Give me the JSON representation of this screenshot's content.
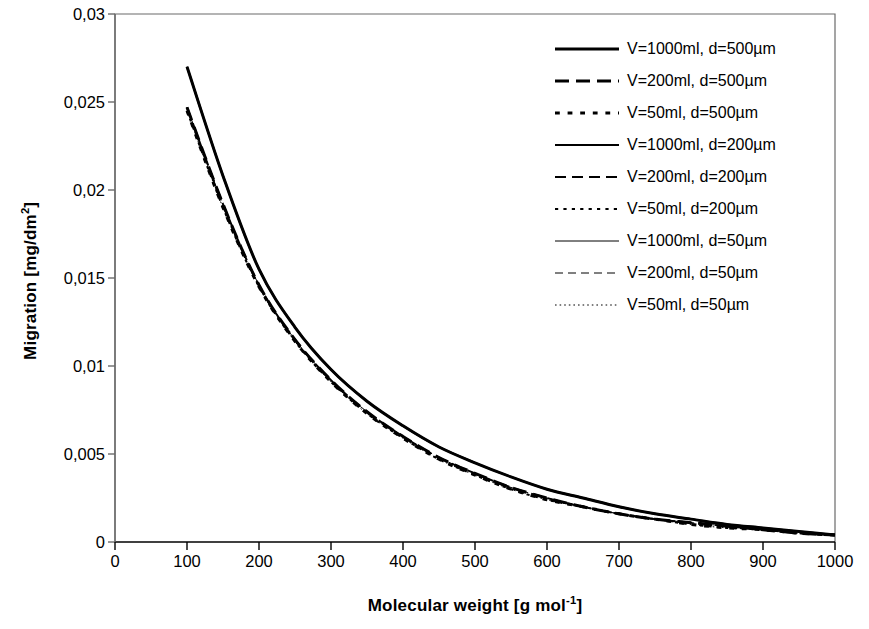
{
  "chart_data": {
    "type": "line",
    "title": "",
    "xlabel": "Molecular weight [g mol-1]",
    "ylabel": "Migration [mg/dm2]",
    "xlim": [
      0,
      1000
    ],
    "ylim": [
      0,
      0.03
    ],
    "grid": false,
    "legend_position": "top-right",
    "x_ticks": [
      "0",
      "100",
      "200",
      "300",
      "400",
      "500",
      "600",
      "700",
      "800",
      "900",
      "1000"
    ],
    "y_ticks": [
      "0",
      "0,005",
      "0,01",
      "0,015",
      "0,02",
      "0,025",
      "0,03"
    ],
    "x": [
      100,
      150,
      200,
      250,
      300,
      350,
      400,
      450,
      500,
      550,
      600,
      650,
      700,
      750,
      800,
      850,
      900,
      950,
      1000
    ],
    "series": [
      {
        "name": "V=1000ml, d=500µm",
        "dash": "solid",
        "width": 3,
        "values": [
          0.027,
          0.0208,
          0.0155,
          0.0122,
          0.0098,
          0.008,
          0.0066,
          0.0054,
          0.0045,
          0.0037,
          0.003,
          0.0025,
          0.002,
          0.0016,
          0.0013,
          0.001,
          0.0008,
          0.0006,
          0.0004
        ]
      },
      {
        "name": "V=200ml, d=500µm",
        "dash": "dashed-long",
        "width": 3,
        "values": [
          0.0247,
          0.0192,
          0.0146,
          0.0115,
          0.0092,
          0.0074,
          0.006,
          0.0048,
          0.0039,
          0.0031,
          0.0025,
          0.002,
          0.0016,
          0.0013,
          0.0011,
          0.0009,
          0.0007,
          0.0005,
          0.0004
        ]
      },
      {
        "name": "V=50ml, d=500µm",
        "dash": "dotted-thick",
        "width": 3,
        "values": [
          0.0245,
          0.019,
          0.0145,
          0.0114,
          0.0091,
          0.0073,
          0.0059,
          0.0047,
          0.0038,
          0.003,
          0.0024,
          0.002,
          0.0016,
          0.0013,
          0.001,
          0.0008,
          0.0007,
          0.0005,
          0.0004
        ]
      },
      {
        "name": "V=1000ml, d=200µm",
        "dash": "solid",
        "width": 2,
        "values": [
          0.027,
          0.0208,
          0.0155,
          0.0122,
          0.0098,
          0.008,
          0.0066,
          0.0054,
          0.0045,
          0.0037,
          0.003,
          0.0025,
          0.002,
          0.0016,
          0.0013,
          0.001,
          0.0008,
          0.0006,
          0.0004
        ]
      },
      {
        "name": "V=200ml, d=200µm",
        "dash": "dashed",
        "width": 2,
        "values": [
          0.0247,
          0.0192,
          0.0146,
          0.0115,
          0.0092,
          0.0074,
          0.006,
          0.0048,
          0.0039,
          0.0031,
          0.0025,
          0.002,
          0.0016,
          0.0013,
          0.0011,
          0.0009,
          0.0007,
          0.0005,
          0.0004
        ]
      },
      {
        "name": "V=50ml, d=200µm",
        "dash": "dotted",
        "width": 2,
        "values": [
          0.0245,
          0.019,
          0.0145,
          0.0114,
          0.0091,
          0.0073,
          0.0059,
          0.0047,
          0.0038,
          0.003,
          0.0024,
          0.002,
          0.0016,
          0.0013,
          0.001,
          0.0008,
          0.0007,
          0.0005,
          0.0004
        ]
      },
      {
        "name": "V=1000ml, d=50µm",
        "dash": "solid",
        "width": 1,
        "values": [
          0.027,
          0.0208,
          0.0155,
          0.0122,
          0.0098,
          0.008,
          0.0066,
          0.0054,
          0.0045,
          0.0037,
          0.003,
          0.0025,
          0.002,
          0.0016,
          0.0013,
          0.001,
          0.0008,
          0.0006,
          0.0004
        ]
      },
      {
        "name": "V=200ml, d=50µm",
        "dash": "dashed-thin",
        "width": 1,
        "values": [
          0.0247,
          0.0192,
          0.0146,
          0.0115,
          0.0092,
          0.0074,
          0.006,
          0.0048,
          0.0039,
          0.0031,
          0.0025,
          0.002,
          0.0016,
          0.0013,
          0.0011,
          0.0009,
          0.0007,
          0.0005,
          0.0004
        ]
      },
      {
        "name": "V=50ml, d=50µm",
        "dash": "dotted-thin",
        "width": 1,
        "values": [
          0.0245,
          0.019,
          0.0145,
          0.0114,
          0.0091,
          0.0073,
          0.0059,
          0.0047,
          0.0038,
          0.003,
          0.0024,
          0.002,
          0.0016,
          0.0013,
          0.001,
          0.0008,
          0.0007,
          0.0005,
          0.0004
        ]
      }
    ]
  },
  "axes": {
    "y_title_main": "Migration [mg/dm",
    "y_title_sup": "2",
    "y_title_tail": "]",
    "x_title_main": "Molecular weight [g mol",
    "x_title_sup": "-1",
    "x_title_tail": "]"
  },
  "legend": {
    "entries": [
      {
        "label": "V=1000ml, d=500µm",
        "style": "solid",
        "width": 3
      },
      {
        "label": "V=200ml, d=500µm",
        "style": "dashed-long",
        "width": 3
      },
      {
        "label": "V=50ml, d=500µm",
        "style": "dotted-thick",
        "width": 3
      },
      {
        "label": "V=1000ml, d=200µm",
        "style": "solid",
        "width": 2
      },
      {
        "label": "V=200ml, d=200µm",
        "style": "dashed",
        "width": 2
      },
      {
        "label": "V=50ml, d=200µm",
        "style": "dotted",
        "width": 2
      },
      {
        "label": "V=1000ml, d=50µm",
        "style": "solid",
        "width": 1
      },
      {
        "label": "V=200ml, d=50µm",
        "style": "dashed-thin",
        "width": 1
      },
      {
        "label": "V=50ml, d=50µm",
        "style": "dotted-thin",
        "width": 1
      }
    ]
  },
  "colors": {
    "ink": "#000000",
    "axis": "#6a6a6a",
    "background": "#ffffff"
  }
}
